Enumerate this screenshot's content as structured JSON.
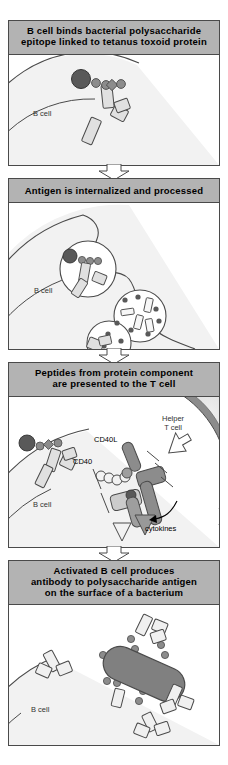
{
  "figure": {
    "title_semantic": "T-cell-dependent B cell response to conjugate vaccine",
    "width": 228,
    "height": 765,
    "colors": {
      "header_background": "#b3b3b3",
      "panel_border": "#4a4a4a",
      "panel_background": "#ffffff",
      "b_cell_fill": "#f2f2f2",
      "t_cell_fill": "#8c8c8c",
      "t_cell_inner_fill": "#d9d9d9",
      "bacterium_fill": "#808080",
      "protein_dark": "#595959",
      "polysaccharide_mid": "#8c8c8c",
      "antibody_fill": "#e6e6e6",
      "mhc_fill": "#cccccc",
      "receptor_fill": "#9e9e9e",
      "cytokine_fill": "#999999",
      "arrow_fill": "#ffffff",
      "text": "#000000",
      "label_text": "#333333"
    }
  },
  "panels": [
    {
      "id": "panel-1",
      "step": 1,
      "header_lines": [
        "B cell binds bacterial polysaccharide",
        "epitope linked to tetanus toxoid protein"
      ],
      "labels": [
        {
          "name": "b-cell-label",
          "text": "B cell"
        }
      ],
      "elements": [
        "b-cell",
        "b-cell-receptor",
        "tetanus-toxoid-protein",
        "polysaccharide-epitope"
      ]
    },
    {
      "id": "panel-2",
      "step": 2,
      "header_lines": [
        "Antigen is internalized and processed"
      ],
      "labels": [
        {
          "name": "b-cell-label",
          "text": "B cell"
        }
      ],
      "elements": [
        "b-cell",
        "endocytic-vesicle",
        "internalized-antigen",
        "lysosome",
        "degraded-peptides",
        "polysaccharide-fragments",
        "receptor-fragment"
      ]
    },
    {
      "id": "panel-3",
      "step": 3,
      "header_lines": [
        "Peptides from protein component",
        "are presented to the T cell"
      ],
      "labels": [
        {
          "name": "b-cell-label",
          "text": "B cell"
        },
        {
          "name": "helper-t-cell-label",
          "text": "Helper\nT cell"
        },
        {
          "name": "helper-t-cell-label-line1",
          "text": "Helper"
        },
        {
          "name": "helper-t-cell-label-line2",
          "text": "T cell"
        },
        {
          "name": "cd40l-label",
          "text": "CD40L"
        },
        {
          "name": "cd40-label",
          "text": "CD40"
        },
        {
          "name": "cytokines-label",
          "text": "cytokines"
        }
      ],
      "elements": [
        "b-cell",
        "helper-t-cell",
        "b-cell-receptor",
        "surface-antigen",
        "mhc-class-ii",
        "presented-peptide",
        "t-cell-receptor",
        "cd40-molecule",
        "cd40-ligand",
        "cytokine-arrows",
        "cytokine-pointer-arrow"
      ]
    },
    {
      "id": "panel-4",
      "step": 4,
      "header_lines": [
        "Activated B cell produces",
        "antibody to polysaccharide antigen",
        "on the surface of a bacterium"
      ],
      "labels": [
        {
          "name": "b-cell-label",
          "text": "B cell"
        }
      ],
      "elements": [
        "b-cell",
        "bacterium",
        "capsular-polysaccharide",
        "secreted-antibody"
      ]
    }
  ],
  "flow_arrows": [
    {
      "name": "flow-arrow-1-to-2",
      "direction": "down"
    },
    {
      "name": "flow-arrow-2-to-3",
      "direction": "down"
    },
    {
      "name": "flow-arrow-3-to-4",
      "direction": "down"
    }
  ]
}
